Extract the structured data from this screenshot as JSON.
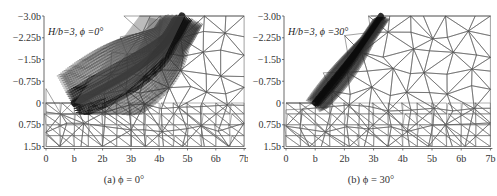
{
  "chart_data": [
    {
      "type": "mesh",
      "panel": "a",
      "annotation": "H/b=3, ϕ =0°",
      "caption": "(a) ϕ = 0°",
      "xlabel": "",
      "ylabel": "",
      "x_ticks": [
        "0",
        "b",
        "2b",
        "3b",
        "4b",
        "5b",
        "6b",
        "7b"
      ],
      "y_ticks": [
        "-3.0b",
        "-2.25b",
        "-1.5b",
        "-0.75b",
        "0",
        "0.75b",
        "1.5b"
      ],
      "xlim": [
        0,
        7
      ],
      "ylim": [
        1.5,
        -3.0
      ],
      "description": "Adaptive finite-element mesh of a vertical cut; dense refinement along a wide curved shear band from toe (x=b, y=0) up to the surface near x=4.8b; coarse triangles elsewhere."
    },
    {
      "type": "mesh",
      "panel": "b",
      "annotation": "H/b=3, ϕ =30°",
      "caption": "(b) ϕ = 30°",
      "xlabel": "",
      "ylabel": "",
      "x_ticks": [
        "0",
        "b",
        "2b",
        "3b",
        "4b",
        "5b",
        "6b",
        "7b"
      ],
      "y_ticks": [
        "-3.0b",
        "-2.25b",
        "-1.5b",
        "-0.75b",
        "0",
        "0.75b",
        "1.5b"
      ],
      "xlim": [
        0,
        7
      ],
      "ylim": [
        1.5,
        -3.0
      ],
      "description": "Adaptive finite-element mesh; dense refinement along a narrow straight shear band from toe (x=b, y=0) to the surface near x=3.3b; coarse triangles elsewhere."
    }
  ]
}
